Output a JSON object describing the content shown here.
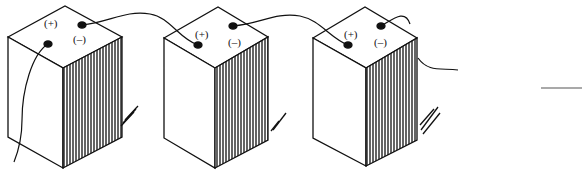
{
  "diagram": {
    "type": "batteries-in-series",
    "batteries": [
      {
        "id": 1,
        "positive_label": "(+)",
        "negative_label": "(–)"
      },
      {
        "id": 2,
        "positive_label": "(+)",
        "negative_label": "(–)"
      },
      {
        "id": 3,
        "positive_label": "(+)",
        "negative_label": "(–)"
      }
    ],
    "colors": {
      "ink": "#111111",
      "background": "#ffffff"
    }
  }
}
